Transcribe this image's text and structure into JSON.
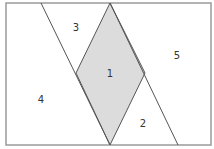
{
  "diagram": {
    "title": "",
    "colors": {
      "frame": "#9a9a9a",
      "line": "#555555",
      "shaded": "#dcdcdc",
      "text": "#333333"
    },
    "frame": {
      "x": 6,
      "y": 3,
      "width": 205,
      "height": 142
    },
    "regions": [
      {
        "id": "1",
        "label": "1",
        "x": 110,
        "y": 77,
        "shaded": true
      },
      {
        "id": "2",
        "label": "2",
        "x": 143,
        "y": 127,
        "shaded": false
      },
      {
        "id": "3",
        "label": "3",
        "x": 76,
        "y": 31,
        "shaded": false
      },
      {
        "id": "4",
        "label": "4",
        "x": 41,
        "y": 103,
        "shaded": false
      },
      {
        "id": "5",
        "label": "5",
        "x": 177,
        "y": 59,
        "shaded": false
      }
    ],
    "rhombus": {
      "top": [
        110,
        3
      ],
      "left": [
        76,
        73
      ],
      "bottom": [
        110,
        145
      ],
      "right": [
        145,
        73
      ]
    },
    "lines": [
      {
        "from": [
          41,
          3
        ],
        "to": [
          110,
          145
        ]
      },
      {
        "from": [
          110,
          3
        ],
        "to": [
          178,
          145
        ]
      }
    ]
  }
}
